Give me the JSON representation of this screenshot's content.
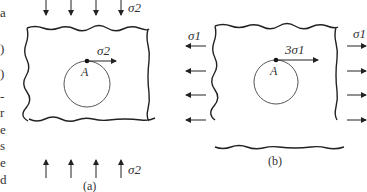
{
  "left_margin_fragments": [
    {
      "text": "a",
      "y": 6
    },
    {
      "text": ")",
      "y": 42
    },
    {
      "text": ")",
      "y": 67
    },
    {
      "text": "-",
      "y": 90
    },
    {
      "text": "r",
      "y": 106
    },
    {
      "text": "e",
      "y": 123
    },
    {
      "text": "s",
      "y": 139
    },
    {
      "text": "e",
      "y": 156
    },
    {
      "text": "d",
      "y": 173
    }
  ],
  "panel_a": {
    "caption": "(a)",
    "top_load_label": "σ2",
    "bottom_load_label": "σ2",
    "point_label": "A",
    "point_stress_label": "σ2",
    "loading": "uniaxial compression (vertical)"
  },
  "panel_b": {
    "caption": "(b)",
    "left_load_label": "σ1",
    "right_load_label": "σ1",
    "point_label": "A",
    "point_stress_label": "3σ1",
    "loading": "uniaxial tension (horizontal)"
  }
}
